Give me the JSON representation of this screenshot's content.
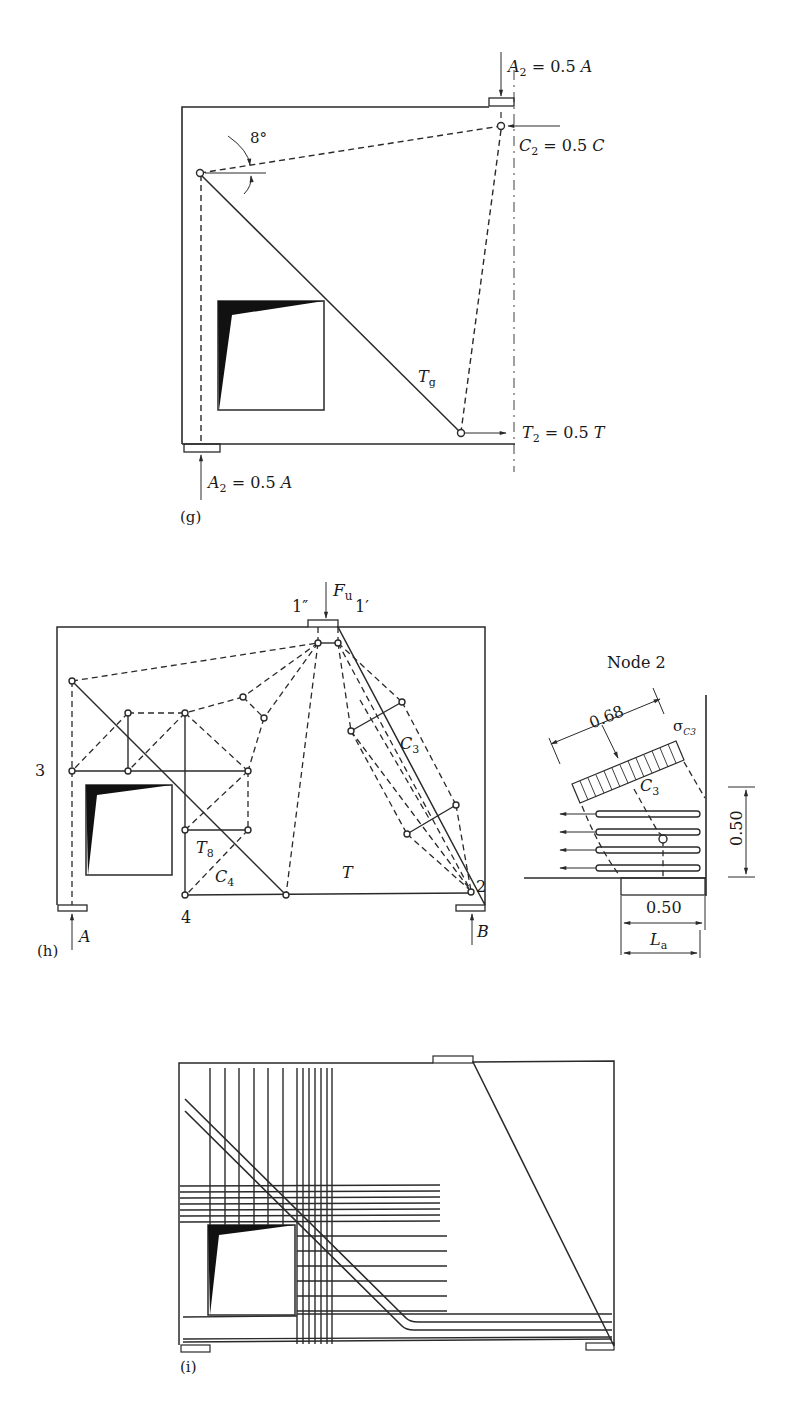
{
  "figure_g": {
    "panel_label": "(g)",
    "angle_label": "8°",
    "top_load": {
      "sym": "A",
      "sub": "2",
      "eq": " = 0.5 ",
      "rhs": "A"
    },
    "compression": {
      "sym": "C",
      "sub": "2",
      "eq": " = 0.5 ",
      "rhs": "C"
    },
    "tie_label": {
      "sym": "T",
      "sub": "g"
    },
    "tension": {
      "sym": "T",
      "sub": "2",
      "eq": " = 0.5 ",
      "rhs": "T"
    },
    "bottom_reaction": {
      "sym": "A",
      "sub": "2",
      "eq": " = 0.5 ",
      "rhs": "A"
    }
  },
  "figure_h": {
    "panel_label": "(h)",
    "load": {
      "sym": "F",
      "sub": "u"
    },
    "node_1pp": "1″",
    "node_1p": "1′",
    "node_3": "3",
    "node_4": "4",
    "node_2": "2",
    "strut_c3": {
      "sym": "C",
      "sub": "3"
    },
    "strut_c4": {
      "sym": "C",
      "sub": "4"
    },
    "tie_t8": {
      "sym": "T",
      "sub": "8"
    },
    "tie_t": "T",
    "reaction_a": "A",
    "reaction_b": "B"
  },
  "node_detail": {
    "title": "Node 2",
    "strut_width": "0.68",
    "stress": {
      "sym": "σ",
      "sub": "C3"
    },
    "strut": {
      "sym": "C",
      "sub": "3"
    },
    "height_dim": "0.50",
    "bearing_dim": "0.50",
    "anchorage": {
      "sym": "L",
      "sub": "a"
    }
  },
  "figure_i": {
    "panel_label": "(i)"
  }
}
